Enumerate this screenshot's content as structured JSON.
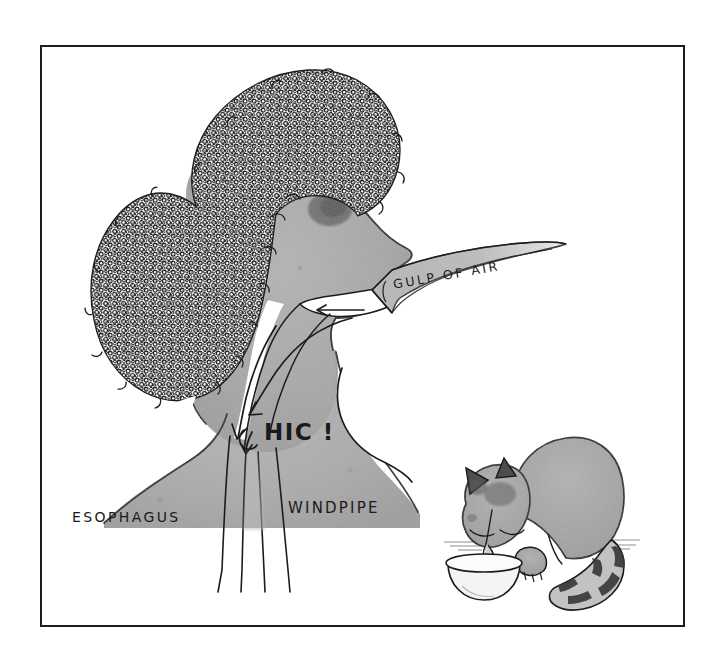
{
  "artwork": {
    "title": "Hiccups diagram — gulp of air",
    "medium": "pen-and-ink with gray wash cartoon illustration",
    "background_color": "#ffffff",
    "frame": {
      "stroke_color": "#1d1d1d",
      "fill_color": "#ffffff",
      "x": 40,
      "y": 45,
      "width": 645,
      "height": 582
    },
    "palette": {
      "ink": "#1a1a1a",
      "wash_light": "#c9c9c9",
      "wash_mid": "#a9a9a9",
      "wash_dark": "#8a8a8a",
      "shadow_dark": "#5d5d5d",
      "hair_ink": "#2a2a2a",
      "paper": "#ffffff"
    }
  },
  "labels": {
    "esophagus": "ESOPHAGUS",
    "windpipe": "WINDPIPE",
    "hiccup": "HIC !",
    "gulp_of_air": "GULP OF AIR"
  },
  "figures": {
    "person": {
      "name": "person-profile",
      "description": "Head and shoulders in left-facing profile with large curly afro hairstyle, open mouth, visible throat passages",
      "hair_style": "afro",
      "facing": "right"
    },
    "cat": {
      "name": "cat-drinking",
      "description": "Hunched cat lapping water from a bowl, ringed striped tail",
      "tail_stripes": 6,
      "bowl": "water-bowl"
    }
  },
  "annotations": {
    "arrows": [
      {
        "name": "gulp-arrow-banner",
        "label": "GULP OF AIR",
        "direction": "right-to-left",
        "target": "mouth"
      },
      {
        "name": "mouth-intake-arrow",
        "direction": "right-to-left",
        "target": "throat"
      },
      {
        "name": "airway-arrow-upper",
        "direction": "down-left",
        "target": "esophagus"
      },
      {
        "name": "airway-arrow-lower",
        "direction": "down",
        "target": "esophagus"
      }
    ],
    "passages": [
      {
        "name": "esophagus-tube",
        "label": "ESOPHAGUS"
      },
      {
        "name": "windpipe-tube",
        "label": "WINDPIPE"
      }
    ]
  }
}
